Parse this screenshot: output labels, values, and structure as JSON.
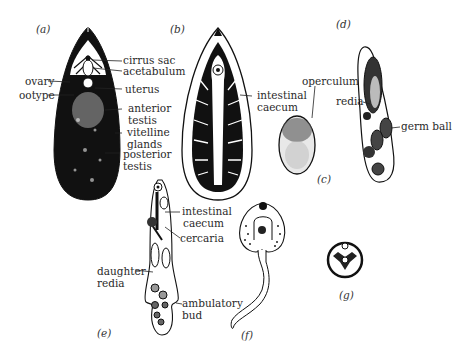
{
  "panels": {
    "a": {
      "letter": "(a)",
      "labels": {
        "cirrus_sac": "cirrus sac",
        "acetabulum": "acetabulum",
        "ovary": "ovary",
        "ootype": "ootype",
        "uterus": "uterus",
        "anterior_testis_1": "anterior",
        "anterior_testis_2": "testis",
        "vitelline_1": "vitelline",
        "vitelline_2": "glands",
        "posterior_testis_1": "posterior",
        "posterior_testis_2": "testis"
      }
    },
    "b": {
      "letter": "(b)",
      "labels": {
        "intestinal_caecum_1": "intestinal",
        "intestinal_caecum_2": "caecum"
      }
    },
    "c": {
      "letter": "(c)",
      "labels": {
        "operculum": "operculum"
      }
    },
    "d": {
      "letter": "(d)",
      "labels": {
        "redia": "redia",
        "germ_ball": "germ ball"
      }
    },
    "e": {
      "letter": "(e)",
      "labels": {
        "intestinal_caecum_1": "intestinal",
        "intestinal_caecum_2": "caecum",
        "cercaria": "cercaria",
        "daughter_redia_1": "daughter",
        "daughter_redia_2": "redia",
        "ambulatory_bud_1": "ambulatory",
        "ambulatory_bud_2": "bud"
      }
    },
    "f": {
      "letter": "(f)"
    },
    "g": {
      "letter": "(g)"
    }
  }
}
